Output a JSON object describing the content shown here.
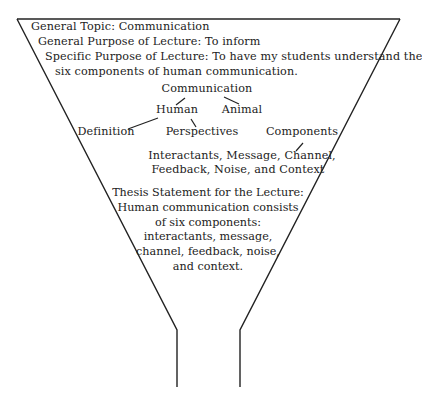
{
  "header": {
    "general_topic": "General Topic: Communication",
    "general_purpose": "General Purpose of Lecture: To inform",
    "specific_purpose_line1": "Specific Purpose of Lecture: To have my students understand the",
    "specific_purpose_line2": "six components of human communication."
  },
  "tree": {
    "root": "Communication",
    "level1": [
      "Human",
      "Animal"
    ],
    "level2": [
      "Definition",
      "Perspectives",
      "Components"
    ],
    "components_line1": "Interactants, Message, Channel,",
    "components_line2": "Feedback, Noise, and Context"
  },
  "thesis": {
    "lines": [
      "Thesis Statement for the Lecture:",
      "Human communication consists",
      "of six components:",
      "interactants, message,",
      "channel, feedback, noise,",
      "and context."
    ]
  },
  "colors": {
    "stroke": "#222222",
    "background": "#ffffff"
  }
}
